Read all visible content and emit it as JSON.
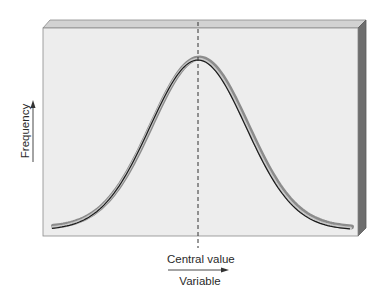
{
  "figure": {
    "type": "normal-distribution-diagram",
    "x_axis": {
      "label": "Variable",
      "marker_label": "Central value"
    },
    "y_axis": {
      "label": "Frequency"
    },
    "colors": {
      "panel_face": "#ededed",
      "panel_top": "#d2d2d2",
      "panel_side": "#6e6e6e",
      "curve_line": "#1a1a1a",
      "curve_band": "#8c8c8c",
      "curve_highlight": "#c8c8c8",
      "dashed_line": "#333333",
      "text": "#2a2a2a"
    }
  },
  "chart_data": {
    "type": "line",
    "title": "",
    "xlabel": "Variable",
    "ylabel": "Frequency",
    "annotations": [
      "Central value"
    ],
    "x": [
      -3,
      -2.5,
      -2,
      -1.5,
      -1,
      -0.5,
      0,
      0.5,
      1,
      1.5,
      2,
      2.5,
      3
    ],
    "values": [
      0.01,
      0.04,
      0.14,
      0.32,
      0.61,
      0.88,
      1.0,
      0.88,
      0.61,
      0.32,
      0.14,
      0.04,
      0.01
    ],
    "grid": false,
    "legend": null
  }
}
